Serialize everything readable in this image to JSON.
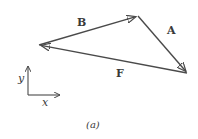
{
  "diagram": {
    "type": "vector-triangle",
    "stroke_color": "#4a4a4a",
    "vertices": {
      "left": [
        39,
        45
      ],
      "top": [
        138,
        16
      ],
      "right": [
        187,
        73
      ]
    },
    "vectors": [
      {
        "name": "B",
        "label": "B",
        "from": "left",
        "to": "top",
        "label_pos": [
          80,
          24
        ]
      },
      {
        "name": "A",
        "label": "A",
        "from": "top",
        "to": "right",
        "label_pos": [
          171,
          33
        ]
      },
      {
        "name": "F",
        "label": "F",
        "from": "right",
        "to": "left",
        "label_pos": [
          119,
          75
        ]
      }
    ],
    "axes": {
      "origin": [
        28,
        95
      ],
      "x_label": "x",
      "y_label": "y"
    },
    "caption": "(a)"
  }
}
